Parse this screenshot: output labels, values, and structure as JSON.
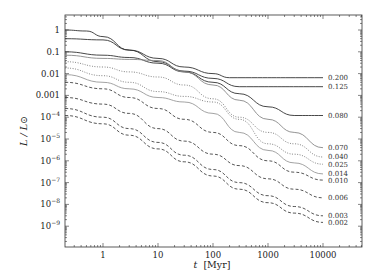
{
  "chart_data": {
    "type": "line",
    "title": "",
    "xlabel": "t [Myr]",
    "ylabel": "L / L⊙",
    "xscale": "log",
    "yscale": "log",
    "xlim": [
      0.2,
      47000
    ],
    "ylim": [
      3e-10,
      4
    ],
    "grid": false,
    "legend_position": "inline labels at right end of curves",
    "x_ticks": [
      "1",
      "10",
      "100",
      "1000",
      "10000"
    ],
    "y_ticks": [
      "1",
      "0.1",
      "0.01",
      "0.001",
      "10^-4",
      "10^-5",
      "10^-6",
      "10^-7",
      "10^-8",
      "10^-9"
    ],
    "series": [
      {
        "name": "0.200",
        "style": "solid",
        "color": "#333333",
        "t": [
          0.2,
          0.5,
          1,
          3,
          10,
          30,
          100,
          200,
          10000
        ],
        "L": [
          1.0,
          0.9,
          0.5,
          0.12,
          0.05,
          0.02,
          0.01,
          0.0065,
          0.0065
        ]
      },
      {
        "name": "0.125",
        "style": "solid",
        "color": "#333333",
        "t": [
          0.2,
          1,
          3,
          10,
          30,
          100,
          300,
          10000
        ],
        "L": [
          0.4,
          0.35,
          0.12,
          0.035,
          0.013,
          0.006,
          0.0025,
          0.0025
        ]
      },
      {
        "name": "0.080",
        "style": "solid",
        "color": "#333333",
        "t": [
          0.2,
          1,
          3,
          10,
          30,
          100,
          300,
          1000,
          3000,
          10000
        ],
        "L": [
          0.1,
          0.07,
          0.055,
          0.03,
          0.012,
          0.004,
          0.0012,
          0.0003,
          0.00012,
          0.00012
        ]
      },
      {
        "name": "0.070",
        "style": "solid-grey",
        "color": "#888888",
        "t": [
          0.2,
          1,
          3,
          10,
          30,
          100,
          300,
          1000,
          3000,
          10000
        ],
        "L": [
          0.07,
          0.05,
          0.045,
          0.04,
          0.012,
          0.003,
          0.0006,
          8e-05,
          2e-05,
          4e-06
        ]
      },
      {
        "name": "0.040",
        "style": "dotted",
        "color": "#777777",
        "t": [
          0.2,
          1,
          3,
          10,
          30,
          100,
          300,
          1000,
          3000,
          10000
        ],
        "L": [
          0.035,
          0.02,
          0.012,
          0.007,
          0.003,
          0.0007,
          0.0001,
          2e-05,
          6e-06,
          1.5e-06
        ]
      },
      {
        "name": "0.025",
        "style": "dotted",
        "color": "#777777",
        "t": [
          0.2,
          1,
          3,
          10,
          30,
          100,
          300,
          1000,
          3000,
          10000
        ],
        "L": [
          0.018,
          0.008,
          0.004,
          0.0015,
          0.0009,
          0.0005,
          8e-05,
          6e-06,
          2e-06,
          7e-07
        ]
      },
      {
        "name": "0.014",
        "style": "solid-grey",
        "color": "#999999",
        "t": [
          0.2,
          1,
          3,
          10,
          30,
          100,
          300,
          1000,
          3000,
          10000
        ],
        "L": [
          0.009,
          0.004,
          0.002,
          0.0008,
          0.0005,
          0.00015,
          2e-05,
          3e-06,
          8e-07,
          2.5e-07
        ]
      },
      {
        "name": "0.010",
        "style": "dashed",
        "color": "#444444",
        "t": [
          0.2,
          1,
          3,
          10,
          30,
          100,
          300,
          1000,
          3000,
          10000
        ],
        "L": [
          0.004,
          0.002,
          0.0008,
          0.00025,
          8e-05,
          2e-05,
          5e-06,
          1e-06,
          3e-07,
          1.3e-07
        ]
      },
      {
        "name": "0.006",
        "style": "dashed",
        "color": "#444444",
        "t": [
          0.2,
          1,
          3,
          10,
          30,
          100,
          300,
          1000,
          3000,
          10000
        ],
        "L": [
          0.0008,
          0.0004,
          0.00015,
          3e-05,
          8e-06,
          2e-06,
          6e-07,
          1.5e-07,
          5e-08,
          2e-08
        ]
      },
      {
        "name": "0.003",
        "style": "dashed",
        "color": "#444444",
        "t": [
          0.2,
          1,
          3,
          10,
          30,
          100,
          300,
          1000,
          3000,
          10000
        ],
        "L": [
          0.00025,
          0.0001,
          3e-05,
          7e-06,
          1.8e-06,
          4e-07,
          1e-07,
          2.5e-08,
          8e-09,
          3e-09
        ]
      },
      {
        "name": "0.002",
        "style": "dashed",
        "color": "#444444",
        "t": [
          0.2,
          1,
          3,
          10,
          30,
          100,
          300,
          1000,
          3000,
          10000
        ],
        "L": [
          0.00012,
          5e-05,
          1.5e-05,
          3.5e-06,
          9e-07,
          2e-07,
          5e-08,
          1.2e-08,
          4e-09,
          1.5e-09
        ]
      }
    ]
  },
  "labels": {
    "xlabel_t": "t",
    "xlabel_unit": "[Myr]",
    "ylabel": "L / L⊙"
  }
}
